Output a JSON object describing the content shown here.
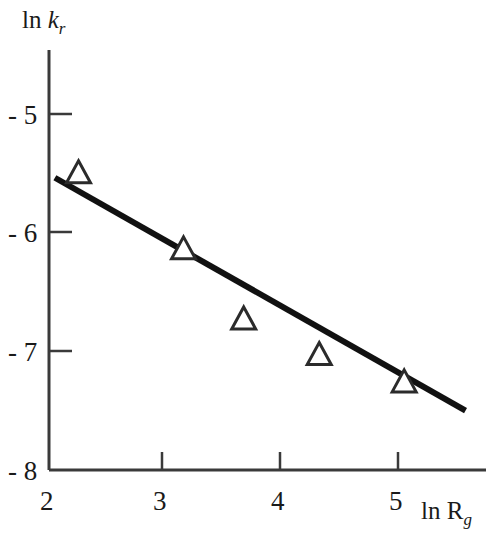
{
  "chart_data": {
    "type": "scatter",
    "title": "",
    "subtitle": "",
    "xlabel": "ln R_g",
    "ylabel": "ln k_r",
    "xlabel_parts": {
      "prefix": "ln R",
      "subscript": "g"
    },
    "ylabel_parts": {
      "prefix": "ln ",
      "italic": "k",
      "subscript": "r"
    },
    "xlim": [
      2,
      5.9
    ],
    "ylim": [
      -8,
      -4.45
    ],
    "xticks": [
      2,
      3,
      4,
      5
    ],
    "yticks": [
      -5,
      -6,
      -7,
      -8
    ],
    "xtick_labels": [
      "2",
      "3",
      "4",
      "5"
    ],
    "ytick_labels": [
      "- 5",
      "- 6",
      "- 7",
      "- 8"
    ],
    "grid": false,
    "legend": "none",
    "marker": "open-triangle-up",
    "marker_color": "#2b2b2b",
    "line_color": "#111111",
    "axis_color": "#3a3a3a",
    "series": [
      {
        "name": "data",
        "x": [
          2.25,
          3.14,
          3.65,
          4.29,
          5.01
        ],
        "y": [
          -5.49,
          -6.13,
          -6.72,
          -7.02,
          -7.25
        ]
      },
      {
        "name": "linear fit",
        "type": "line",
        "x": [
          2.05,
          5.53
        ],
        "y": [
          -5.54,
          -7.5
        ],
        "slope": -0.56,
        "intercept": -4.39
      }
    ]
  },
  "axes": {
    "y_axis_name": "ln k_r",
    "x_axis_name": "ln R_g"
  }
}
